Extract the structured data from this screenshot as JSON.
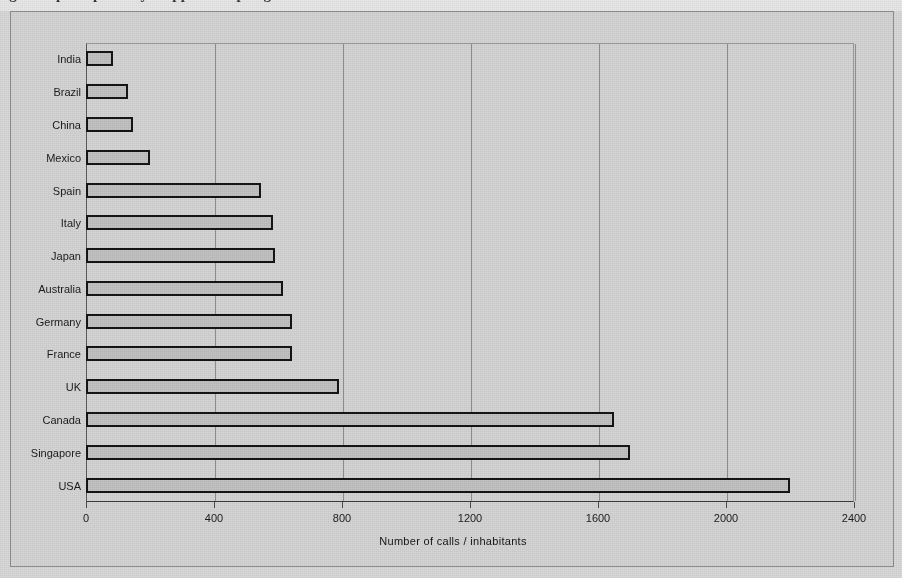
{
  "page": {
    "background_color": "#d9d9d9",
    "frame_color": "#8e8e8e",
    "bar_fill_color": "#c2c2c2",
    "bar_border_color": "#151515",
    "gridline_color": "#8f8f8f",
    "cropped_caption_fragment": "figure caption partially cropped at top edge"
  },
  "chart_data": {
    "type": "bar",
    "orientation": "horizontal",
    "title": "",
    "xlabel": "Number of calls / inhabitants",
    "ylabel": "",
    "xlim": [
      0,
      2400
    ],
    "ylim": null,
    "grid": true,
    "grid_axis": "x",
    "legend": false,
    "legend_position": "none",
    "xticks": [
      0,
      400,
      800,
      1200,
      1600,
      2000,
      2400
    ],
    "xticklabels": [
      "0",
      "400",
      "800",
      "1200",
      "1600",
      "2000",
      "2400"
    ],
    "categories": [
      "India",
      "Brazil",
      "China",
      "Mexico",
      "Spain",
      "Italy",
      "Japan",
      "Australia",
      "Germany",
      "France",
      "UK",
      "Canada",
      "Singapore",
      "USA"
    ],
    "values": [
      85,
      132,
      147,
      200,
      548,
      585,
      592,
      617,
      645,
      645,
      790,
      1650,
      1700,
      2200
    ],
    "points": [
      {
        "category": "India",
        "value": 85
      },
      {
        "category": "Brazil",
        "value": 132
      },
      {
        "category": "China",
        "value": 147
      },
      {
        "category": "Mexico",
        "value": 200
      },
      {
        "category": "Spain",
        "value": 548
      },
      {
        "category": "Italy",
        "value": 585
      },
      {
        "category": "Japan",
        "value": 592
      },
      {
        "category": "Australia",
        "value": 617
      },
      {
        "category": "Germany",
        "value": 645
      },
      {
        "category": "France",
        "value": 645
      },
      {
        "category": "UK",
        "value": 790
      },
      {
        "category": "Canada",
        "value": 1650
      },
      {
        "category": "Singapore",
        "value": 1700
      },
      {
        "category": "USA",
        "value": 2200
      }
    ]
  }
}
